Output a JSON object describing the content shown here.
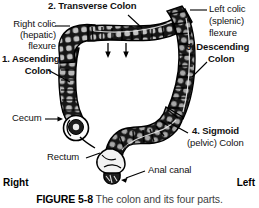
{
  "figure": {
    "caption_number": "FIGURE 5-8",
    "caption_text": "The colon and its four parts.",
    "orientation_left": "Left",
    "orientation_right": "Right"
  },
  "labels": {
    "transverse": "2. Transverse Colon",
    "right_colic_1": "Right colic",
    "right_colic_2": "(hepatic)",
    "right_colic_3": "flexure",
    "ascending_1": "1. Ascending",
    "ascending_2": "Colon",
    "left_colic_1": "Left colic",
    "left_colic_2": "(splenic)",
    "left_colic_3": "flexure",
    "descending_1": "3. Descending",
    "descending_2": "Colon",
    "cecum": "Cecum",
    "rectum": "Rectum",
    "anal_canal": "Anal canal",
    "sigmoid_1": "4. Sigmoid",
    "sigmoid_2a": "(pelvic) ",
    "sigmoid_2b": "Colon"
  },
  "colors": {
    "ink": "#111111",
    "caption_grey": "#3f3f3f",
    "organ_dark": "#1a1a1a",
    "organ_mid": "#8f8f8f",
    "organ_light": "#c9c9c9",
    "background": "#ffffff"
  },
  "icons": {
    "arrow_down_1": "arrow-down-icon",
    "arrow_down_2": "arrow-down-icon"
  }
}
